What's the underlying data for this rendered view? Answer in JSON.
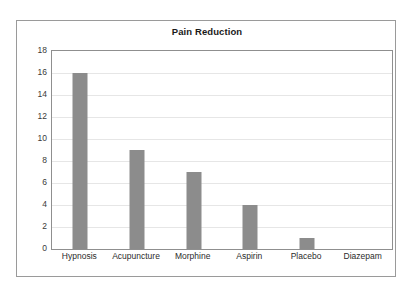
{
  "chart_data": {
    "type": "bar",
    "title": "Pain Reduction",
    "xlabel": "",
    "ylabel": "",
    "categories": [
      "Hypnosis",
      "Acupuncture",
      "Morphine",
      "Aspirin",
      "Placebo",
      "Diazepam"
    ],
    "values": [
      16,
      9,
      7,
      4,
      1,
      0
    ],
    "series": [
      {
        "name": "Pain Reduction",
        "values": [
          16,
          9,
          7,
          4,
          1,
          0
        ]
      }
    ],
    "ylim": [
      0,
      18
    ],
    "ytick_step": 2,
    "yticks": [
      0,
      2,
      4,
      6,
      8,
      10,
      12,
      14,
      16,
      18
    ],
    "ytick_labels": [
      "0",
      "2",
      "4",
      "6",
      "8",
      "10",
      "12",
      "14",
      "16",
      "18"
    ],
    "grid": true,
    "grid_axis": "y",
    "legend": false,
    "legend_position": "none",
    "bar_color": "#8c8c8c",
    "gridline_color": "#e6e6e6",
    "plot_border_color": "#8f8f8f",
    "frame_border_color": "#9a9a9a",
    "background_color": "#ffffff",
    "title_color": "#1a1a1a",
    "tick_label_color": "#3a3a3a"
  }
}
